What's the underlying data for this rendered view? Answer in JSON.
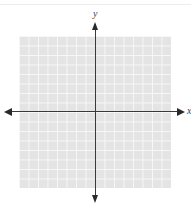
{
  "chart_data": {
    "type": "scatter",
    "title": "",
    "xlabel": "x",
    "ylabel": "y",
    "grid": true,
    "grid_cells": {
      "columns": 16,
      "rows": 16
    },
    "xlim": [
      -8,
      8
    ],
    "ylim": [
      -8,
      8
    ],
    "axes_arrows": true,
    "series": [],
    "colors": {
      "grid_fill": "#e4e4e4",
      "grid_lines": "#f7f7f7",
      "axes": "#3a3a3a"
    }
  },
  "labels": {
    "x_axis": "x",
    "y_axis": "y"
  }
}
